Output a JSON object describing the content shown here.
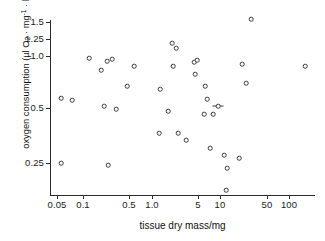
{
  "chart_data": {
    "type": "scatter",
    "title": "",
    "xlabel": "tissue dry mass/mg",
    "ylabel": "oxygen consumption (μl O₂ · mg⁻¹ · h⁻¹)",
    "xscale": "log",
    "yscale": "log",
    "xlim": [
      0.045,
      130
    ],
    "ylim": [
      0.1,
      1.7
    ],
    "grid": false,
    "legend": null,
    "xticks": [
      {
        "value": 0.05,
        "label": "0.05",
        "px": 57
      },
      {
        "value": 0.1,
        "label": "0.1",
        "px": 83
      },
      {
        "value": 0.5,
        "label": "0.5",
        "px": 129
      },
      {
        "value": 1.0,
        "label": "1.0",
        "px": 152
      },
      {
        "value": 5,
        "label": "5",
        "px": 198
      },
      {
        "value": 10,
        "label": "10",
        "px": 220
      },
      {
        "value": 50,
        "label": "50",
        "px": 267
      },
      {
        "value": 100,
        "label": "100",
        "px": 289
      }
    ],
    "yticks": [
      {
        "value": 1.5,
        "label": "1.5",
        "px": 22
      },
      {
        "value": 1.25,
        "label": "1.25",
        "px": 39
      },
      {
        "value": 1.0,
        "label": "1.0",
        "px": 56
      },
      {
        "value": 0.5,
        "label": "0.5",
        "px": 108
      },
      {
        "value": 0.25,
        "label": "0.25",
        "px": 163
      }
    ],
    "points": [
      {
        "x": 0.058,
        "y": 0.615,
        "px": 61,
        "py": 98
      },
      {
        "x": 0.058,
        "y": 0.248,
        "px": 61,
        "py": 163
      },
      {
        "x": 0.078,
        "y": 0.6,
        "px": 72,
        "py": 100
      },
      {
        "x": 0.115,
        "y": 1.035,
        "px": 89,
        "py": 58
      },
      {
        "x": 0.155,
        "y": 0.905,
        "px": 101,
        "py": 70
      },
      {
        "x": 0.168,
        "y": 0.54,
        "px": 104,
        "py": 106
      },
      {
        "x": 0.182,
        "y": 1.01,
        "px": 107,
        "py": 61
      },
      {
        "x": 0.188,
        "y": 0.243,
        "px": 108,
        "py": 165
      },
      {
        "x": 0.205,
        "y": 1.03,
        "px": 112,
        "py": 59
      },
      {
        "x": 0.225,
        "y": 0.52,
        "px": 116,
        "py": 109
      },
      {
        "x": 0.285,
        "y": 0.725,
        "px": 127,
        "py": 86
      },
      {
        "x": 0.335,
        "y": 0.945,
        "px": 134,
        "py": 66
      },
      {
        "x": 0.62,
        "y": 0.7,
        "px": 160,
        "py": 89
      },
      {
        "x": 0.6,
        "y": 0.4,
        "px": 159,
        "py": 133
      },
      {
        "x": 0.82,
        "y": 0.51,
        "px": 168,
        "py": 111
      },
      {
        "x": 0.93,
        "y": 1.215,
        "px": 172,
        "py": 43
      },
      {
        "x": 0.95,
        "y": 0.935,
        "px": 173,
        "py": 66
      },
      {
        "x": 1.02,
        "y": 1.15,
        "px": 176,
        "py": 48
      },
      {
        "x": 1.1,
        "y": 0.4,
        "px": 178,
        "py": 133
      },
      {
        "x": 1.45,
        "y": 0.36,
        "px": 186,
        "py": 140
      },
      {
        "x": 2.0,
        "y": 1.0,
        "px": 194,
        "py": 62
      },
      {
        "x": 2.05,
        "y": 0.86,
        "px": 195,
        "py": 74
      },
      {
        "x": 2.25,
        "y": 1.015,
        "px": 197,
        "py": 60
      },
      {
        "x": 2.95,
        "y": 0.725,
        "px": 205,
        "py": 86
      },
      {
        "x": 2.9,
        "y": 0.49,
        "px": 204,
        "py": 114
      },
      {
        "x": 3.3,
        "y": 0.61,
        "px": 207,
        "py": 99
      },
      {
        "x": 3.7,
        "y": 0.315,
        "px": 210,
        "py": 148
      },
      {
        "x": 4.2,
        "y": 0.49,
        "px": 213,
        "py": 114
      },
      {
        "x": 5.0,
        "y": 0.545,
        "px": 218,
        "py": 106,
        "errbar": true
      },
      {
        "x": 6.6,
        "y": 0.29,
        "px": 224,
        "py": 155
      },
      {
        "x": 7.3,
        "y": 0.235,
        "px": 227,
        "py": 168
      },
      {
        "x": 7.1,
        "y": 0.135,
        "px": 226,
        "py": 190
      },
      {
        "x": 11.5,
        "y": 0.275,
        "px": 239,
        "py": 158
      },
      {
        "x": 13.0,
        "y": 0.955,
        "px": 242,
        "py": 64
      },
      {
        "x": 15.5,
        "y": 0.76,
        "px": 246,
        "py": 83
      },
      {
        "x": 19.0,
        "y": 1.56,
        "px": 251,
        "py": 19
      },
      {
        "x": 110,
        "y": 0.935,
        "px": 305,
        "py": 66
      }
    ]
  }
}
